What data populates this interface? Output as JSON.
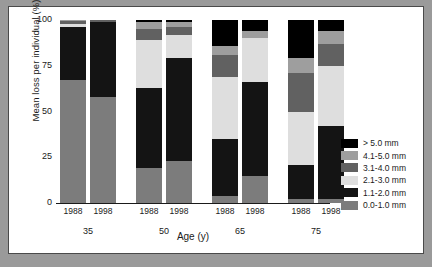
{
  "chart_data": {
    "type": "bar",
    "subtype": "stacked-bar-grouped-100percent",
    "title": "",
    "xlabel": "Age (y)",
    "ylabel": "Mean loss per individual (%)",
    "ylim": [
      0,
      100
    ],
    "yticks": [
      0,
      25,
      50,
      75,
      100
    ],
    "ytick_labels": [
      "0",
      "25",
      "50",
      "75",
      "100"
    ],
    "grid": false,
    "legend_position": "right",
    "groups": [
      "35",
      "50",
      "65",
      "75"
    ],
    "group_labels": [
      "35",
      "50",
      "65",
      "75"
    ],
    "years": [
      "1988",
      "1998"
    ],
    "categories": [
      "35 1988",
      "35 1998",
      "50 1988",
      "50 1998",
      "65 1988",
      "65 1998",
      "75 1988",
      "75 1998"
    ],
    "series": [
      {
        "name": "0.0-1.0 mm",
        "color": "#7c7c7c",
        "values": [
          67,
          58,
          19,
          23,
          4,
          15,
          2,
          2
        ]
      },
      {
        "name": "1.1-2.0 mm",
        "color": "#141414",
        "values": [
          29,
          41,
          44,
          56,
          31,
          51,
          19,
          40
        ]
      },
      {
        "name": "2.1-3.0 mm",
        "color": "#dedede",
        "values": [
          2,
          0,
          26,
          13,
          34,
          24,
          29,
          33
        ]
      },
      {
        "name": "3.1-4.0 mm",
        "color": "#616161",
        "values": [
          1.5,
          1,
          6,
          4,
          12,
          0,
          21,
          12
        ]
      },
      {
        "name": "4.1-5.0 mm",
        "color": "#9e9e9e",
        "values": [
          0.5,
          0,
          4,
          3,
          5,
          4,
          8,
          7
        ]
      },
      {
        "name": "> 5.0 mm",
        "color": "#000000",
        "values": [
          0,
          0,
          1,
          1,
          14,
          6,
          21,
          6
        ]
      }
    ],
    "legend_entries": [
      {
        "label": "> 5.0 mm",
        "color": "#000000"
      },
      {
        "label": "4.1-5.0 mm",
        "color": "#9e9e9e"
      },
      {
        "label": "3.1-4.0 mm",
        "color": "#616161"
      },
      {
        "label": "2.1-3.0 mm",
        "color": "#dedede"
      },
      {
        "label": "1.1-2.0 mm",
        "color": "#141414"
      },
      {
        "label": "0.0-1.0 mm",
        "color": "#7c7c7c"
      }
    ],
    "stack_order_bottom_to_top": [
      "0.0-1.0 mm",
      "1.1-2.0 mm",
      "2.1-3.0 mm",
      "3.1-4.0 mm",
      "4.1-5.0 mm",
      "> 5.0 mm"
    ]
  },
  "figure": {
    "background": "#ffffff",
    "page_background": "#9a9a9a",
    "border_color": "#4a4a4a"
  }
}
